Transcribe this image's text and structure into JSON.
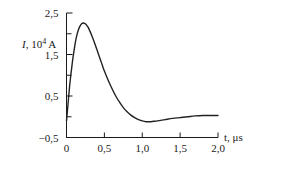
{
  "chart_data": {
    "type": "line",
    "title": "",
    "subtitle": "",
    "xlabel": "t, μs",
    "ylabel": "I, 10⁴ A",
    "ylabel_symbol": "I",
    "ylabel_rest": ", 10",
    "ylabel_exponent": "4",
    "ylabel_unit": "A",
    "xlabel_symbol": "t",
    "xlabel_rest": ", μs",
    "xlim": [
      0,
      2.0
    ],
    "ylim": [
      -0.5,
      2.5
    ],
    "grid": false,
    "legend": null,
    "decimal_separator": ",",
    "xticks": [
      0,
      0.5,
      1.0,
      1.5,
      2.0
    ],
    "xtick_labels": [
      "0",
      "0,5",
      "1,0",
      "1,5",
      "2,0"
    ],
    "yticks": [
      -0.5,
      0,
      0.5,
      1.0,
      1.5,
      2.0,
      2.5
    ],
    "ytick_labels": [
      "−0,5",
      "",
      "0,5",
      "",
      "1,5",
      "",
      "2,5"
    ],
    "ytick_labels_shown": [
      "−0,5",
      "0,5",
      "1,5",
      "2,5"
    ],
    "ytick_labels_shown_values": [
      -0.5,
      0.5,
      1.5,
      2.5
    ],
    "series": [
      {
        "name": "I(t)",
        "color": "#222222",
        "linewidth": 1.4,
        "x": [
          0.0,
          0.02,
          0.04,
          0.06,
          0.08,
          0.1,
          0.12,
          0.14,
          0.16,
          0.18,
          0.2,
          0.22,
          0.24,
          0.26,
          0.28,
          0.3,
          0.34,
          0.38,
          0.42,
          0.46,
          0.5,
          0.55,
          0.6,
          0.65,
          0.7,
          0.75,
          0.8,
          0.85,
          0.9,
          0.95,
          1.0,
          1.05,
          1.1,
          1.15,
          1.2,
          1.3,
          1.4,
          1.5,
          1.6,
          1.7,
          1.8,
          1.9,
          2.0
        ],
        "y": [
          -0.1,
          0.3,
          0.72,
          1.05,
          1.35,
          1.6,
          1.82,
          1.99,
          2.11,
          2.19,
          2.24,
          2.26,
          2.25,
          2.22,
          2.17,
          2.1,
          1.93,
          1.73,
          1.52,
          1.31,
          1.1,
          0.88,
          0.68,
          0.5,
          0.35,
          0.22,
          0.12,
          0.04,
          -0.02,
          -0.07,
          -0.1,
          -0.12,
          -0.12,
          -0.11,
          -0.1,
          -0.07,
          -0.04,
          -0.02,
          0.0,
          0.02,
          0.03,
          0.03,
          0.03
        ]
      }
    ],
    "annotations": {
      "peak_value": 2.26,
      "peak_time": 0.22,
      "min_value": -0.12,
      "min_time": 1.07,
      "zero_crossing_rise": 0.005,
      "zero_crossing_fall": 0.88
    }
  }
}
